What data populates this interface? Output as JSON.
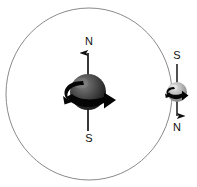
{
  "diagram": {
    "background_color": "#ffffff",
    "orbit": {
      "name": "orbit-circle",
      "center_x": 89,
      "center_y": 94,
      "radius_x": 83,
      "radius_y": 86,
      "stroke_color": "#8a8a8a",
      "stroke_width": 1
    },
    "bodies": [
      {
        "id": "primary",
        "name": "large-sphere",
        "center_x": 88,
        "center_y": 92,
        "radius": 18,
        "fill_light": "#6e6e6e",
        "fill_dark": "#1c1c1c",
        "axis": {
          "top_y": 50,
          "bottom_y": 131,
          "stroke_color": "#141414",
          "stroke_width": 1.6,
          "arrow_direction": "up"
        },
        "labels": {
          "top": "N",
          "top_x": 89,
          "top_y": 42,
          "bottom": "S",
          "bottom_x": 89,
          "bottom_y": 139
        },
        "rotation_arrow": {
          "name": "rotation-arrow-large",
          "direction": "clockwise-front-right",
          "color": "#050505"
        }
      },
      {
        "id": "secondary",
        "name": "small-sphere",
        "center_x": 177,
        "center_y": 92,
        "radius": 10,
        "fill_light": "#d8d8d8",
        "fill_dark": "#7a7a7a",
        "axis": {
          "top_y": 64,
          "bottom_y": 120,
          "stroke_color": "#141414",
          "stroke_width": 1.4,
          "arrow_direction": "down"
        },
        "labels": {
          "top": "S",
          "top_x": 177,
          "top_y": 56,
          "bottom": "N",
          "bottom_x": 177,
          "bottom_y": 128
        },
        "rotation_arrow": {
          "name": "rotation-arrow-small",
          "direction": "clockwise-front-right",
          "color": "#050505"
        }
      }
    ]
  }
}
